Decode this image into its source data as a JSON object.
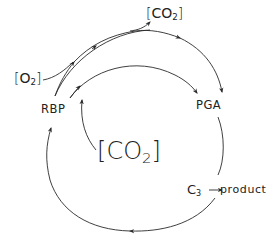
{
  "diagram": {
    "nodes": {
      "rbp": "RBP",
      "pga": "PGA",
      "c3": {
        "base": "C",
        "subscript": "3"
      },
      "product": "product"
    },
    "species": {
      "o2_in": {
        "open": "[",
        "base": "O",
        "subscript": "2",
        "close": "]"
      },
      "co2_out": {
        "open": "[",
        "base": "CO",
        "subscript": "2",
        "close": "]"
      },
      "co2_center": {
        "open": "[",
        "base": "CO",
        "subscript": "2",
        "close": "]"
      }
    },
    "edges": [
      {
        "from": "RBP",
        "to": "PGA",
        "via": "outer arc (oxygenation)",
        "inputs": [
          "O2"
        ],
        "outputs": [
          "CO2"
        ]
      },
      {
        "from": "RBP",
        "to": "PGA",
        "via": "inner arc (carboxylation)",
        "inputs": [
          "CO2"
        ]
      },
      {
        "from": "PGA",
        "to": "C3"
      },
      {
        "from": "C3",
        "to": "product"
      },
      {
        "from": "C3",
        "to": "RBP",
        "via": "lower regeneration arc"
      }
    ],
    "colors": {
      "line": "#2a2a2a",
      "text": "#222222",
      "background": "#ffffff"
    }
  }
}
